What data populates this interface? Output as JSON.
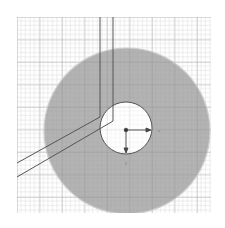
{
  "diagram": {
    "type": "cad-sketch",
    "grid": {
      "x": 17,
      "y": 17,
      "width": 194,
      "height": 196,
      "minor_step": 4.5,
      "major_every": 5,
      "color": "#bdbdbd"
    },
    "disc": {
      "cx": 127,
      "cy": 131,
      "r": 83,
      "fill": "#a8a8a8",
      "stroke": "#c8c8c8"
    },
    "hole": {
      "cx": 126,
      "cy": 128,
      "r": 26,
      "fill": "#ffffff",
      "stroke": "#555555"
    },
    "origin": {
      "x": 126,
      "y": 130
    },
    "axes": {
      "x_label": "x",
      "y_label": "y"
    },
    "path_lines": {
      "color": "#555555"
    }
  }
}
